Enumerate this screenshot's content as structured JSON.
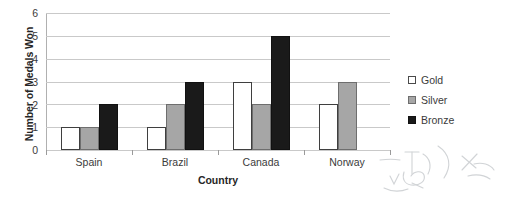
{
  "chart_data": {
    "type": "bar",
    "title": "",
    "xlabel": "Country",
    "ylabel": "Number of Medals Won",
    "categories": [
      "Spain",
      "Brazil",
      "Canada",
      "Norway"
    ],
    "series": [
      {
        "name": "Gold",
        "values": [
          1,
          1,
          3,
          2
        ],
        "color": "#FFFFFF"
      },
      {
        "name": "Silver",
        "values": [
          1,
          2,
          2,
          3
        ],
        "color": "#A6A6A6"
      },
      {
        "name": "Bronze",
        "values": [
          2,
          3,
          5,
          0
        ],
        "color": "#1A1A1A"
      }
    ],
    "ylim": [
      0,
      6
    ],
    "yticks": [
      0,
      1,
      2,
      3,
      4,
      5,
      6
    ],
    "ytick_labels": [
      "0",
      "1",
      "2",
      "3",
      "4",
      "5",
      "6"
    ],
    "grid": "horizontal",
    "legend_position": "right",
    "grouping": "clustered"
  },
  "axes": {
    "y_title": "Number of Medals Won",
    "x_title": "Country"
  },
  "legend": {
    "entries": [
      {
        "label": "Gold",
        "swatch": "gold-swatch-icon"
      },
      {
        "label": "Silver",
        "swatch": "silver-swatch-icon"
      },
      {
        "label": "Bronze",
        "swatch": "bronze-swatch-icon"
      }
    ]
  },
  "colors": {
    "gold": "#FFFFFF",
    "silver": "#A6A6A6",
    "bronze": "#1A1A1A",
    "gridline": "#C9C9C9",
    "axis": "#8C8C8C",
    "text": "#3B3B3B"
  }
}
